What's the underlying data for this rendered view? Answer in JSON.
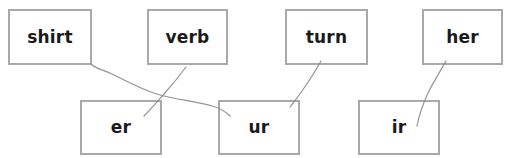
{
  "worksheet": {
    "background_color": "#ffffff",
    "box_border_color": "#a9a9ac",
    "text_color": "#1b1b1b",
    "pencil_line_color": "#8a8a8f",
    "clipped_header_remnant": "",
    "top_row_label": "Words",
    "bottom_row_label": "Spelling patterns",
    "top_row": [
      {
        "id": "shirt",
        "text": "shirt",
        "x": 8,
        "y": 9,
        "width": 84,
        "height": 56
      },
      {
        "id": "verb",
        "text": "verb",
        "x": 147,
        "y": 9,
        "width": 81,
        "height": 56
      },
      {
        "id": "turn",
        "text": "turn",
        "x": 285,
        "y": 9,
        "width": 83,
        "height": 56
      },
      {
        "id": "her",
        "text": "her",
        "x": 422,
        "y": 9,
        "width": 81,
        "height": 56
      }
    ],
    "bottom_row": [
      {
        "id": "er",
        "text": "er",
        "x": 80,
        "y": 100,
        "width": 82,
        "height": 55
      },
      {
        "id": "ur",
        "text": "ur",
        "x": 218,
        "y": 100,
        "width": 82,
        "height": 55
      },
      {
        "id": "ir",
        "text": "ir",
        "x": 358,
        "y": 100,
        "width": 82,
        "height": 55
      }
    ],
    "connections": [
      {
        "id": "shirt-to-ur",
        "from": "shirt",
        "to": "ur",
        "path": "M 91 64 C 96 69, 104 70, 112 74 C 126 81, 142 90, 160 95 C 178 100, 196 101, 212 106 C 220 108, 226 112, 230 116"
      },
      {
        "id": "verb-to-er",
        "from": "verb",
        "to": "er",
        "path": "M 186 67 C 180 75, 172 85, 164 94 C 156 103, 150 110, 144 116"
      },
      {
        "id": "turn-to-ur",
        "from": "turn",
        "to": "ur",
        "path": "M 321 61 C 316 70, 309 81, 302 91 C 297 98, 293 103, 290 107"
      },
      {
        "id": "her-to-ir",
        "from": "her",
        "to": "ir",
        "path": "M 446 61 C 441 70, 434 81, 428 93 C 423 104, 419 115, 417 126"
      }
    ]
  }
}
